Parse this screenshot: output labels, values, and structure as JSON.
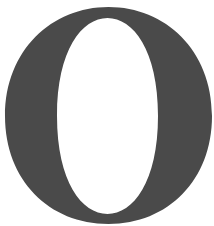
{
  "glyph": {
    "character": "O",
    "style": "bold serif capital letter",
    "fill_color": "#4a4a4a",
    "background_color": "#ffffff"
  }
}
